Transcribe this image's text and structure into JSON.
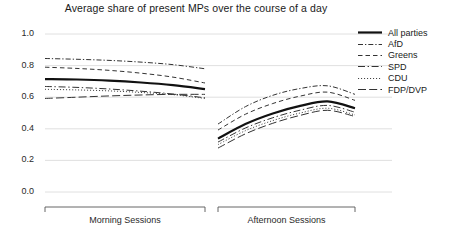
{
  "chart_data": {
    "type": "line",
    "title": "Average share of present MPs over the course of a day",
    "xlabel": "",
    "ylabel": "",
    "ylim": [
      0.0,
      1.0
    ],
    "yticks": [
      "0.0",
      "0.2",
      "0.4",
      "0.6",
      "0.8",
      "1.0"
    ],
    "ytick_values": [
      0.0,
      0.2,
      0.4,
      0.6,
      0.8,
      1.0
    ],
    "grid": true,
    "legend_position": "right",
    "panels": [
      {
        "name": "morning",
        "label": "Morning Sessions",
        "x": [
          0,
          0.2,
          0.4,
          0.6,
          0.8,
          1.0
        ]
      },
      {
        "name": "afternoon",
        "label": "Afternoon Sessions",
        "x": [
          0,
          0.2,
          0.4,
          0.6,
          0.8,
          1.0
        ]
      }
    ],
    "series": [
      {
        "name": "All parties",
        "style": "solid",
        "color": "#111111",
        "width": 2.2,
        "morning": [
          0.715,
          0.712,
          0.705,
          0.693,
          0.676,
          0.651
        ],
        "afternoon": [
          0.338,
          0.43,
          0.497,
          0.545,
          0.573,
          0.53
        ]
      },
      {
        "name": "AfD",
        "style": "dashdot",
        "color": "#333333",
        "width": 1.0,
        "morning": [
          0.845,
          0.84,
          0.833,
          0.822,
          0.806,
          0.78
        ],
        "afternoon": [
          0.43,
          0.54,
          0.612,
          0.655,
          0.672,
          0.618
        ]
      },
      {
        "name": "Greens",
        "style": "dashed",
        "color": "#333333",
        "width": 1.0,
        "morning": [
          0.79,
          0.782,
          0.77,
          0.752,
          0.727,
          0.69
        ],
        "afternoon": [
          0.392,
          0.492,
          0.56,
          0.607,
          0.632,
          0.58
        ]
      },
      {
        "name": "SPD",
        "style": "longdashdot",
        "color": "#333333",
        "width": 1.0,
        "morning": [
          0.668,
          0.662,
          0.652,
          0.638,
          0.62,
          0.596
        ],
        "afternoon": [
          0.316,
          0.405,
          0.47,
          0.518,
          0.548,
          0.505
        ]
      },
      {
        "name": "CDU",
        "style": "dotted",
        "color": "#444444",
        "width": 1.0,
        "morning": [
          0.65,
          0.646,
          0.64,
          0.63,
          0.616,
          0.592
        ],
        "afternoon": [
          0.3,
          0.388,
          0.452,
          0.5,
          0.53,
          0.488
        ]
      },
      {
        "name": "FDP/DVP",
        "style": "dashdash",
        "color": "#333333",
        "width": 1.0,
        "morning": [
          0.592,
          0.6,
          0.608,
          0.614,
          0.618,
          0.618
        ],
        "afternoon": [
          0.278,
          0.368,
          0.435,
          0.485,
          0.517,
          0.478
        ]
      }
    ]
  },
  "axis": {
    "group_labels": [
      "Morning Sessions",
      "Afternoon Sessions"
    ]
  }
}
